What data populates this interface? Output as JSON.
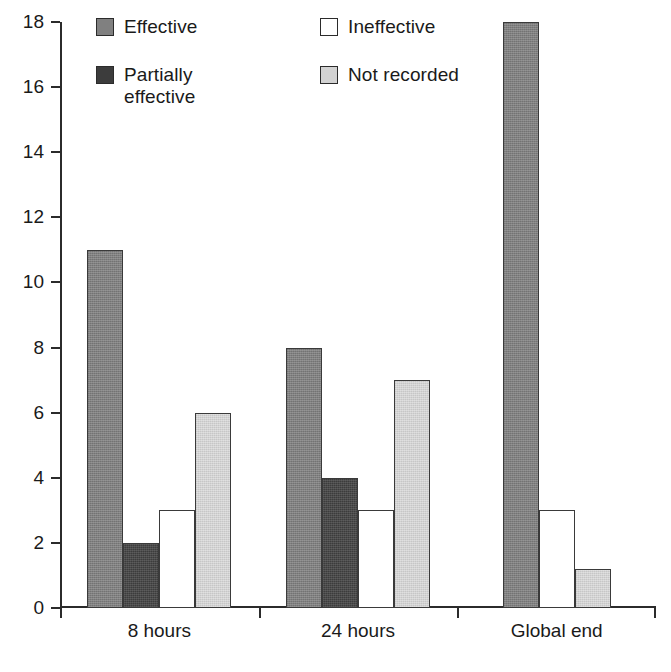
{
  "chart_data": {
    "type": "bar",
    "title": "",
    "subtitle": "",
    "xlabel": "",
    "ylabel": "",
    "categories": [
      "8 hours",
      "24 hours",
      "Global end"
    ],
    "ylim": [
      0,
      18
    ],
    "ytick_labels": [
      "0",
      "2",
      "4",
      "6",
      "8",
      "10",
      "12",
      "14",
      "16",
      "18"
    ],
    "ytick_values": [
      0,
      2,
      4,
      6,
      8,
      10,
      12,
      14,
      16,
      18
    ],
    "grid": false,
    "legend_position": "top-inside",
    "series": [
      {
        "name": "Effective",
        "legend_label": "Effective",
        "color": "#808080",
        "values": [
          11,
          8,
          18
        ]
      },
      {
        "name": "Partially effective",
        "legend_label": "Partially\neffective",
        "color": "#3c3c3c",
        "values": [
          2,
          4,
          null
        ]
      },
      {
        "name": "Ineffective",
        "legend_label": "Ineffective",
        "color": "#ffffff",
        "values": [
          3,
          3,
          3
        ]
      },
      {
        "name": "Not recorded",
        "legend_label": "Not recorded",
        "color": "#d2d2d2",
        "values": [
          6,
          7,
          1.2
        ]
      }
    ]
  },
  "axis": {
    "tick_0": "0",
    "tick_2": "2",
    "tick_4": "4",
    "tick_6": "6",
    "tick_8": "8",
    "tick_10": "10",
    "tick_12": "12",
    "tick_14": "14",
    "tick_16": "16",
    "tick_18": "18"
  },
  "groups": {
    "g0": "8 hours",
    "g1": "24 hours",
    "g2": "Global end"
  },
  "legend": {
    "effective": "Effective",
    "partially_effective": "Partially\neffective",
    "ineffective": "Ineffective",
    "not_recorded": "Not recorded"
  }
}
